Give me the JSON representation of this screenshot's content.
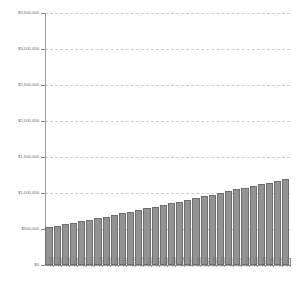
{
  "chart_data": {
    "type": "bar",
    "title": "",
    "subtitle": "",
    "xlabel": "",
    "ylabel": "",
    "ylim": [
      0,
      3500000
    ],
    "grid": true,
    "legend": false,
    "y_ticks": [
      0,
      500000,
      1000000,
      1500000,
      2000000,
      2500000,
      3000000,
      3500000
    ],
    "y_tick_labels": [
      "$0",
      "$500,000",
      "$1,000,000",
      "$1,500,000",
      "$2,000,000",
      "$2,500,000",
      "$3,000,000",
      "$3,500,000"
    ],
    "bar_color": "#939393",
    "bar_edge_color": "#6e6e6e",
    "grid_color": "#cfcfcf",
    "axis_color": "#9a9a9a",
    "tick_label_color": "#6f6f6f",
    "categories": [
      "2008",
      "2009",
      "2010",
      "2011",
      "2012",
      "2013",
      "2014",
      "2015",
      "2016",
      "2017",
      "2018",
      "2019",
      "2020",
      "2021",
      "2022",
      "2023",
      "2024",
      "2025",
      "2026",
      "2027",
      "2028",
      "2029",
      "2030",
      "2031",
      "2032",
      "2033",
      "2034",
      "2035",
      "2036",
      "2037"
    ],
    "values": [
      530000,
      548000,
      568000,
      588000,
      608000,
      628000,
      650000,
      672000,
      694000,
      716000,
      740000,
      762000,
      786000,
      810000,
      834000,
      858000,
      882000,
      906000,
      930000,
      954000,
      978000,
      1002000,
      1026000,
      1050000,
      1074000,
      1098000,
      1122000,
      1146000,
      1172000,
      1200000
    ]
  }
}
